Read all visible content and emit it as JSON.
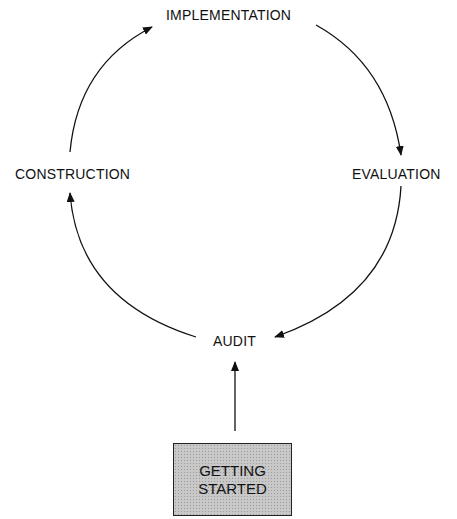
{
  "diagram": {
    "nodes": {
      "implementation": "IMPLEMENTATION",
      "evaluation": "EVALUATION",
      "audit": "AUDIT",
      "construction": "CONSTRUCTION",
      "start_line1": "GETTING",
      "start_line2": "STARTED"
    },
    "edges": [
      {
        "from": "GETTING STARTED",
        "to": "AUDIT"
      },
      {
        "from": "AUDIT",
        "to": "CONSTRUCTION"
      },
      {
        "from": "CONSTRUCTION",
        "to": "IMPLEMENTATION"
      },
      {
        "from": "IMPLEMENTATION",
        "to": "EVALUATION"
      },
      {
        "from": "EVALUATION",
        "to": "AUDIT"
      }
    ],
    "colors": {
      "line": "#111111",
      "box_fill": "#c8c8c8"
    }
  }
}
